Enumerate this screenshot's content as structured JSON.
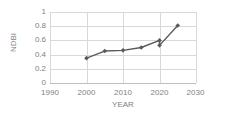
{
  "chart_data": {
    "type": "line",
    "title": "",
    "xlabel": "YEAR",
    "ylabel": "NDBI",
    "xlim": [
      1990,
      2030
    ],
    "ylim": [
      0,
      1
    ],
    "xticks": [
      1990,
      2000,
      2010,
      2020,
      2030
    ],
    "ytick_labels": [
      "1",
      "0.8",
      "0.6",
      "0.4",
      "0.2",
      "0"
    ],
    "yticks": [
      1,
      0.8,
      0.6,
      0.4,
      0.2,
      0
    ],
    "grid": true,
    "legend": "none",
    "marker": "diamond",
    "series_color": "#595959",
    "grid_color": "#d9d9d9",
    "tick_color": "#7f7f7f",
    "x": [
      2000,
      2005,
      2010,
      2015,
      2020,
      2020,
      2025
    ],
    "values": [
      0.35,
      0.45,
      0.46,
      0.5,
      0.6,
      0.53,
      0.81
    ],
    "points": [
      {
        "x": 2000,
        "y": 0.35
      },
      {
        "x": 2005,
        "y": 0.45
      },
      {
        "x": 2010,
        "y": 0.46
      },
      {
        "x": 2015,
        "y": 0.5
      },
      {
        "x": 2020,
        "y": 0.6
      },
      {
        "x": 2020,
        "y": 0.53
      },
      {
        "x": 2025,
        "y": 0.81
      }
    ]
  },
  "axes": {
    "y_label": "NDBI",
    "x_label": "YEAR",
    "y_ticks": [
      "1",
      "0.8",
      "0.6",
      "0.4",
      "0.2",
      "0"
    ],
    "x_ticks": [
      "1990",
      "2000",
      "2010",
      "2020",
      "2030"
    ]
  }
}
